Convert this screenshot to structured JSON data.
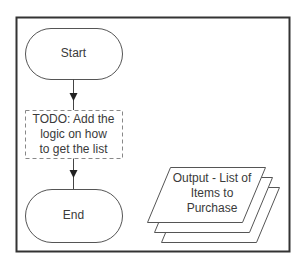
{
  "diagram": {
    "type": "flowchart",
    "colors": {
      "stroke": "#555555",
      "frame": "#333333",
      "dash": "#888888",
      "text": "#3a3a3a",
      "background": "#ffffff"
    },
    "nodes": [
      {
        "id": "start",
        "shape": "terminal",
        "label": "Start"
      },
      {
        "id": "todo",
        "shape": "dashed-process",
        "lines": [
          "TODO: Add the",
          "logic on how",
          "to get the list"
        ]
      },
      {
        "id": "end",
        "shape": "terminal",
        "label": "End"
      },
      {
        "id": "output",
        "shape": "multi-document-data",
        "lines": [
          "Output - List of",
          "Items to",
          "Purchase"
        ]
      }
    ],
    "edges": [
      {
        "from": "start",
        "to": "todo"
      },
      {
        "from": "todo",
        "to": "end"
      }
    ]
  }
}
